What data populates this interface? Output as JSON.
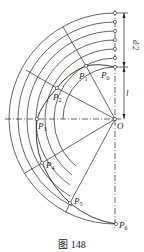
{
  "figure": {
    "caption": "图 148",
    "center_label": "O",
    "points": [
      {
        "name": "P",
        "sub": "0",
        "x": 115,
        "y": 67
      },
      {
        "name": "P",
        "sub": "1",
        "x": 86,
        "y": 66
      },
      {
        "name": "P",
        "sub": "2",
        "x": 57,
        "y": 88
      },
      {
        "name": "P",
        "sub": "3",
        "x": 37,
        "y": 119
      },
      {
        "name": "P",
        "sub": "4",
        "x": 42,
        "y": 163
      },
      {
        "name": "P",
        "sub": "5",
        "x": 70,
        "y": 203
      },
      {
        "name": "P",
        "sub": "6",
        "x": 116,
        "y": 224
      }
    ],
    "dimensions": [
      {
        "label": "d/2",
        "from_y": 13,
        "to_y": 67
      },
      {
        "label": "l",
        "from_y": 67,
        "to_y": 119
      }
    ],
    "colors": {
      "line": "#222222",
      "background": "#ffffff"
    }
  }
}
